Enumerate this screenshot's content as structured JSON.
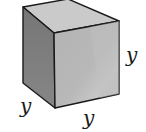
{
  "figure": {
    "type": "cube",
    "colors": {
      "top_face": "#cacaca",
      "left_face": "#7c7c7c",
      "front_face": "#b6b6b6",
      "front_highlight": "#c4c4c4",
      "edge": "#1a1a1a"
    },
    "labels": {
      "left_edge": "y",
      "bottom_edge": "y",
      "right_edge": "y"
    }
  }
}
